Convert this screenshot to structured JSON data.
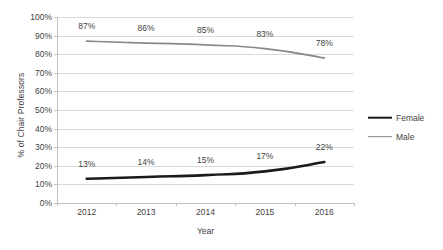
{
  "chart_data": {
    "type": "line",
    "title": "",
    "xlabel": "Year",
    "ylabel": "% of Chair Professors",
    "categories": [
      "2012",
      "2013",
      "2014",
      "2015",
      "2016"
    ],
    "ylim": [
      0,
      100
    ],
    "y_ticks": [
      "0%",
      "10%",
      "20%",
      "30%",
      "40%",
      "50%",
      "60%",
      "70%",
      "80%",
      "90%",
      "100%"
    ],
    "y_tick_values": [
      0,
      10,
      20,
      30,
      40,
      50,
      60,
      70,
      80,
      90,
      100
    ],
    "grid": true,
    "legend_position": "right",
    "series": [
      {
        "name": "Female",
        "color": "#1a1a1a",
        "width": 2.6,
        "values": [
          13,
          14,
          15,
          17,
          22
        ],
        "labels": [
          "13%",
          "14%",
          "15%",
          "17%",
          "22%"
        ]
      },
      {
        "name": "Male",
        "color": "#898989",
        "width": 1.7,
        "values": [
          87,
          86,
          85,
          83,
          78
        ],
        "labels": [
          "87%",
          "86%",
          "85%",
          "83%",
          "78%"
        ]
      }
    ]
  },
  "legend": {
    "items": [
      {
        "label": "Female"
      },
      {
        "label": "Male"
      }
    ]
  }
}
